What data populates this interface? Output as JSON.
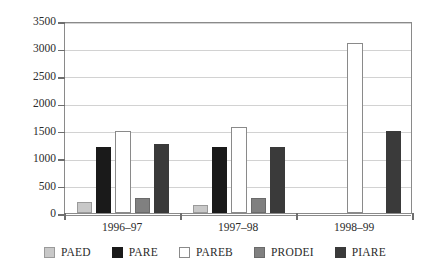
{
  "chart_data": {
    "type": "bar",
    "title": "",
    "subtitle": "",
    "xlabel": "",
    "ylabel": "",
    "ylim": [
      0,
      3500
    ],
    "ytick_step": 500,
    "yticks": [
      0,
      500,
      1000,
      1500,
      2000,
      2500,
      3000,
      3500
    ],
    "ytick_labels": [
      "0",
      "500",
      "1000",
      "1500",
      "2000",
      "2500",
      "3000",
      "3500"
    ],
    "categories": [
      "1996–97",
      "1997–98",
      "1998–99"
    ],
    "grid": "horizontal",
    "legend_position": "bottom",
    "series": [
      {
        "name": "PAED",
        "color": "#c8c8c8",
        "border": "#9a9a9a",
        "values": [
          200,
          150,
          0
        ]
      },
      {
        "name": "PARE",
        "color": "#1a1a1a",
        "border": "#1a1a1a",
        "values": [
          1200,
          1200,
          0
        ]
      },
      {
        "name": "PAREB",
        "color": "#ffffff",
        "border": "#8a8a8a",
        "values": [
          1500,
          1570,
          3100
        ]
      },
      {
        "name": "PRODEI",
        "color": "#808080",
        "border": "#6a6a6a",
        "values": [
          270,
          280,
          0
        ]
      },
      {
        "name": "PIARE",
        "color": "#3a3a3a",
        "border": "#3a3a3a",
        "values": [
          1250,
          1200,
          1500
        ]
      }
    ]
  },
  "legend": {
    "items": [
      {
        "label": "PAED"
      },
      {
        "label": "PARE"
      },
      {
        "label": "PAREB"
      },
      {
        "label": "PRODEI"
      },
      {
        "label": "PIARE"
      }
    ]
  }
}
